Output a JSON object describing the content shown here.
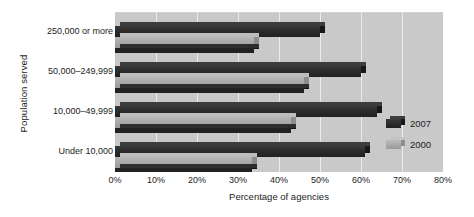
{
  "chart_data": {
    "type": "bar",
    "orientation": "horizontal",
    "title": "",
    "xlabel": "Percentage of agencies",
    "ylabel": "Population served",
    "categories": [
      "250,000 or more",
      "50,000–249,999",
      "10,000–49,999",
      "Under 10,000"
    ],
    "series": [
      {
        "name": "2007",
        "color": "#2b2b2b",
        "values": [
          50,
          60,
          64,
          61
        ]
      },
      {
        "name": "2000",
        "color": "#a9a9a9",
        "values": [
          34,
          46,
          43,
          33.5
        ]
      }
    ],
    "xlim": [
      0,
      80
    ],
    "xtick_labels": [
      "0%",
      "10%",
      "20%",
      "30%",
      "40%",
      "50%",
      "60%",
      "70%",
      "80%"
    ],
    "xtick_values": [
      0,
      10,
      20,
      30,
      40,
      50,
      60,
      70,
      80
    ],
    "grid": true,
    "grid_axis": "x",
    "legend_position": "right",
    "plot_background": "#c9c9c9",
    "gridline_color": "#eceaea",
    "style": "3d-bar"
  },
  "legend": {
    "entries": [
      {
        "label": "2007"
      },
      {
        "label": "2000"
      }
    ]
  }
}
